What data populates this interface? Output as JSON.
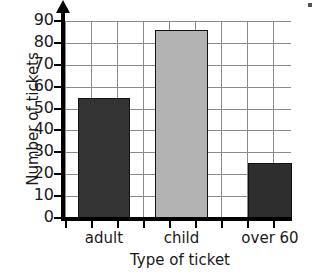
{
  "chart_data": {
    "type": "bar",
    "title": "",
    "categories": [
      "adult",
      "child",
      "over 60"
    ],
    "values": [
      55,
      86,
      25
    ],
    "series": [
      {
        "name": "Number of tickets",
        "values": [
          55,
          86,
          25
        ]
      }
    ],
    "xlabel": "Type of ticket",
    "ylabel": "Number of tickets",
    "ylim": [
      0,
      90
    ],
    "ytick_labels": [
      "0",
      "10",
      "20",
      "30",
      "40",
      "50",
      "60",
      "70",
      "80",
      "90"
    ],
    "ytick_values": [
      0,
      10,
      20,
      30,
      40,
      50,
      60,
      70,
      80,
      90
    ],
    "grid": true,
    "legend": "none",
    "bar_colors": [
      "#333333",
      "#b3b3b3",
      "#2e2e2e"
    ],
    "bar_edge_color": "#111111",
    "grid_color": "#8a8a8a",
    "axis_color": "#000000"
  }
}
